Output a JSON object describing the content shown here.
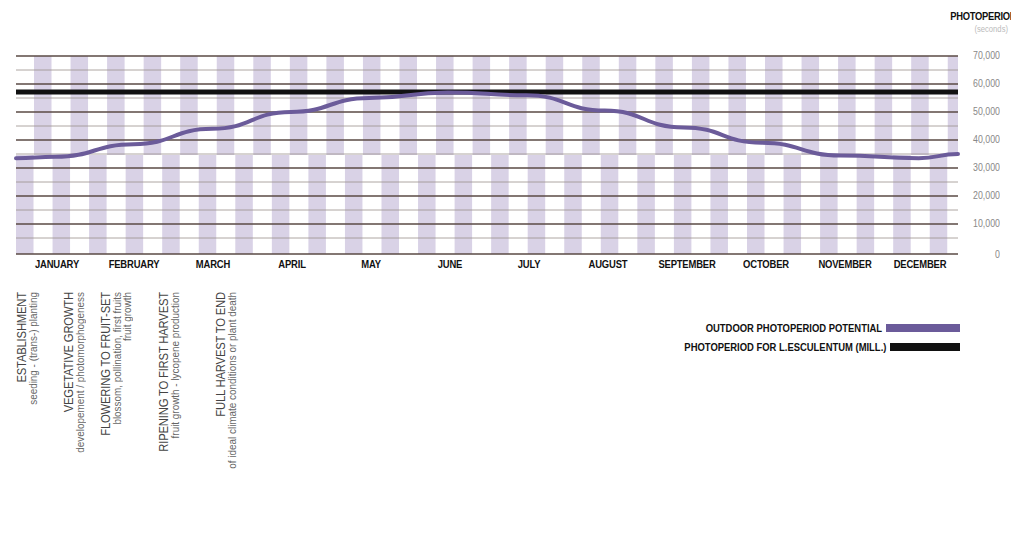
{
  "chart_data": {
    "type": "line",
    "title": "",
    "ylabel": "PHOTOPERIOD",
    "yunit": "(seconds)",
    "xlabel": "",
    "ylim": [
      0,
      70000
    ],
    "yticks": [
      "70,000",
      "60,000",
      "50,000",
      "40,000",
      "30,000",
      "20,000",
      "10,000",
      "0"
    ],
    "categories": [
      "JANUARY",
      "FEBRUARY",
      "MARCH",
      "APRIL",
      "MAY",
      "JUNE",
      "JULY",
      "AUGUST",
      "SEPTEMBER",
      "OCTOBER",
      "NOVEMBER",
      "DECEMBER"
    ],
    "grid": true,
    "legend_position": "bottom-right",
    "series": [
      {
        "name": "OUTDOOR PHOTOPERIOD POTENTIAL",
        "color": "#6b5b9a",
        "values": [
          34000,
          38500,
          44000,
          50000,
          55000,
          57000,
          56000,
          50500,
          44500,
          39000,
          34500,
          33500
        ],
        "end_value": 35000
      },
      {
        "name": "PHOTOPERIOD FOR L.ESCULENTUM (MILL.)",
        "color": "#111111",
        "values": [
          57000,
          57000,
          57000,
          57000,
          57000,
          57000,
          57000,
          57000,
          57000,
          57000,
          57000,
          57000
        ]
      }
    ]
  },
  "axis": {
    "title": "PHOTOPERIOD",
    "unit": "(seconds)",
    "ticks": [
      "70,000",
      "60,000",
      "50,000",
      "40,000",
      "30,000",
      "20,000",
      "10,000",
      "0"
    ]
  },
  "months": [
    "JANUARY",
    "FEBRUARY",
    "MARCH",
    "APRIL",
    "MAY",
    "JUNE",
    "JULY",
    "AUGUST",
    "SEPTEMBER",
    "OCTOBER",
    "NOVEMBER",
    "DECEMBER"
  ],
  "stages": [
    {
      "title": "ESTABLISHMENT",
      "sub": [
        "seeding - (trans-) planting"
      ]
    },
    {
      "title": "VEGETATIVE GROWTH",
      "sub": [
        "developement / photomorphogeness"
      ]
    },
    {
      "title": "FLOWERING TO FRUIT-SET",
      "sub": [
        "blossom, pollination, first fruits",
        "fruit growth"
      ]
    },
    {
      "title": "RIPENING TO FIRST HARVEST",
      "sub": [
        "fruit growth - lycopene production"
      ]
    },
    {
      "title": "FULL HARVEST TO END",
      "sub": [
        "of ideal climate conditions or plant death"
      ]
    }
  ],
  "legend": [
    {
      "label": "OUTDOOR PHOTOPERIOD POTENTIAL",
      "color": "#6b5b9a"
    },
    {
      "label": "PHOTOPERIOD FOR L.ESCULENTUM (MILL.)",
      "color": "#111111"
    }
  ],
  "colors": {
    "stripe": "#d9d2e6",
    "grid_major": "#5a4a44",
    "grid_minor": "#9a8f8c"
  }
}
